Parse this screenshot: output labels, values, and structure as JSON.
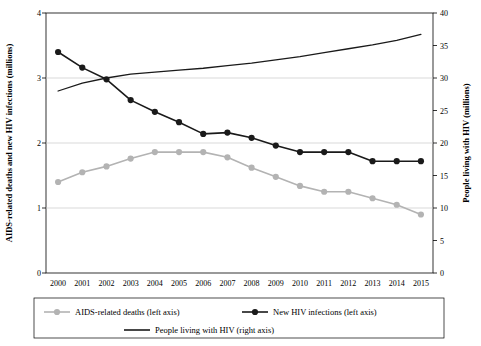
{
  "chart_data": {
    "type": "line",
    "title": "",
    "xlabel": "",
    "categories": [
      "2000",
      "2001",
      "2002",
      "2003",
      "2004",
      "2005",
      "2006",
      "2007",
      "2008",
      "2009",
      "2010",
      "2011",
      "2012",
      "2013",
      "2014",
      "2015"
    ],
    "left_axis": {
      "label": "AIDS-related deaths and new HIV infections (millions)",
      "ylim": [
        0,
        4
      ],
      "ticks": [
        "0",
        "1",
        "2",
        "3",
        "4"
      ],
      "grid": true
    },
    "right_axis": {
      "label": "People living with HIV (millions)",
      "ylim": [
        0,
        40
      ],
      "ticks": [
        "0",
        "5",
        "10",
        "15",
        "20",
        "25",
        "30",
        "35",
        "40"
      ],
      "grid": false
    },
    "series": [
      {
        "name": "AIDS-related deaths (left axis)",
        "axis": "left",
        "color": "#b3b3b3",
        "marker": "circle",
        "values": [
          1.4,
          1.55,
          1.64,
          1.76,
          1.86,
          1.86,
          1.86,
          1.78,
          1.62,
          1.48,
          1.34,
          1.25,
          1.25,
          1.15,
          1.05,
          0.9
        ]
      },
      {
        "name": "New HIV infections (left axis)",
        "axis": "left",
        "color": "#1a1a1a",
        "marker": "circle",
        "values": [
          3.4,
          3.16,
          2.98,
          2.66,
          2.48,
          2.32,
          2.14,
          2.16,
          2.08,
          1.96,
          1.86,
          1.86,
          1.86,
          1.72,
          1.72,
          1.72
        ]
      },
      {
        "name": "People living with HIV (right axis)",
        "axis": "right",
        "color": "#1a1a1a",
        "marker": "none",
        "values": [
          28.0,
          29.2,
          30.0,
          30.6,
          30.9,
          31.2,
          31.5,
          31.9,
          32.3,
          32.8,
          33.3,
          33.9,
          34.5,
          35.1,
          35.8,
          36.7
        ]
      }
    ]
  },
  "legend": {
    "row1": [
      {
        "label": "AIDS-related deaths (left axis)",
        "color": "#b3b3b3",
        "marker": "line-circle"
      },
      {
        "label": "New HIV infections (left axis)",
        "color": "#1a1a1a",
        "marker": "line-circle"
      }
    ],
    "row2": [
      {
        "label": "People living with HIV (right axis)",
        "color": "#1a1a1a",
        "marker": "line"
      }
    ]
  }
}
